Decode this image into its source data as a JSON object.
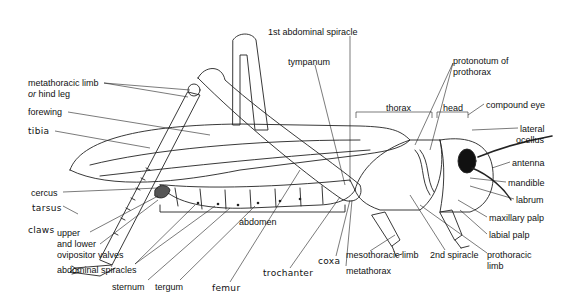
{
  "diagram": {
    "labels": {
      "metathoracic_limb_1": "metathoracic limb",
      "metathoracic_limb_or": "or",
      "metathoracic_limb_2": "hind leg",
      "forewing": "forewing",
      "tibia": "tibia",
      "cercus": "cercus",
      "tarsus": "tarsus",
      "claws": "claws",
      "ovipositor_1": "upper",
      "ovipositor_2": "and lower",
      "ovipositor_3": "ovipositor valves",
      "abdominal_spiracles": "abdominal spiracles",
      "sternum": "sternum",
      "tergum": "tergum",
      "femur": "femur",
      "abdomen": "abdomen",
      "trochanter": "trochanter",
      "coxa": "coxa",
      "metathorax": "metathorax",
      "mesothoracic_limb": "mesothoracic limb",
      "second_spiracle": "2nd spiracle",
      "prothoracic_limb_1": "prothoracic",
      "prothoracic_limb_2": "limb",
      "first_abdominal_spiracle": "1st abdominal spiracle",
      "tympanum": "tympanum",
      "thorax": "thorax",
      "head": "head",
      "protonotum_1": "protonotum of",
      "protonotum_2": "prothorax",
      "compound_eye": "compound eye",
      "lateral_ocellus_1": "lateral",
      "lateral_ocellus_2": "ocellus",
      "antenna": "antenna",
      "mandible": "mandible",
      "labrum": "labrum",
      "maxillary_palp": "maxillary palp",
      "labial_palp": "labial palp"
    }
  }
}
